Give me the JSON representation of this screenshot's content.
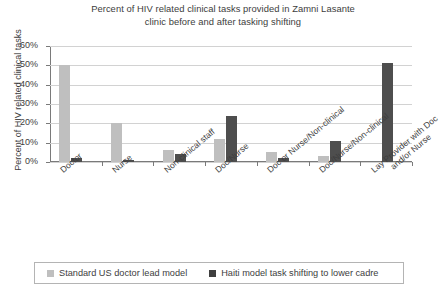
{
  "chart_data": {
    "type": "bar",
    "title": "Percent of HIV related clinical tasks provided in Zamni Lasante clinic before and after tasking shifting",
    "title_line1": "Percent of HIV related clinical tasks provided in Zamni Lasante",
    "title_line2": "clinic before and after tasking shifting",
    "xlabel": "",
    "ylabel": "Percent of HIV related clinical tasks",
    "ylim": [
      0,
      60
    ],
    "ytick_labels": [
      "0%",
      "10%",
      "20%",
      "30%",
      "40%",
      "50%",
      "60%"
    ],
    "ytick_values": [
      0,
      10,
      20,
      30,
      40,
      50,
      60
    ],
    "grid": true,
    "legend_position": "bottom",
    "categories": [
      "Doctor",
      "Nurse",
      "Non-clinical staff",
      "Doc/Nurse",
      "Doc or Nurse/Non-clinical",
      "Doc/Nurse/Non-clinical",
      "Lay Provider with Doc and/or Nurse"
    ],
    "category_labels": [
      {
        "line1": "Doctor",
        "line2": ""
      },
      {
        "line1": "Nurse",
        "line2": ""
      },
      {
        "line1": "Non-clinical staff",
        "line2": ""
      },
      {
        "line1": "Doc/Nurse",
        "line2": ""
      },
      {
        "line1": "Doc or Nurse/Non-clinical",
        "line2": ""
      },
      {
        "line1": "Doc/Nurse/Non-clinical",
        "line2": ""
      },
      {
        "line1": "Lay Provider with Doc",
        "line2": "and/or Nurse"
      }
    ],
    "series": [
      {
        "name": "Standard US doctor lead model",
        "color": "#bfbfbf",
        "values": [
          50,
          20,
          6,
          12,
          5,
          3,
          0
        ]
      },
      {
        "name": "Haiti model task shifting to lower cadre",
        "color": "#4e4e4e",
        "values": [
          2,
          1,
          4,
          24,
          2,
          11,
          51
        ]
      }
    ]
  },
  "legend": {
    "entries": [
      {
        "label": "Standard US doctor lead model",
        "color": "#bfbfbf"
      },
      {
        "label": "Haiti model task shifting to lower cadre",
        "color": "#3f3f3f"
      }
    ]
  }
}
